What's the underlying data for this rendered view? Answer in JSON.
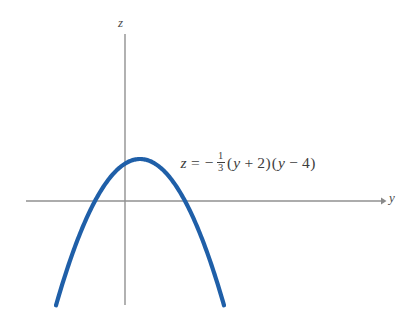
{
  "figure": {
    "background_color": "#ffffff",
    "width": 413,
    "height": 317
  },
  "axes": {
    "color": "#919191",
    "vertical": {
      "label": "z",
      "x_px": 125,
      "y_top_px": 34,
      "y_bottom_px": 305
    },
    "horizontal": {
      "label": "y",
      "y_px": 201,
      "x_left_px": 26,
      "x_right_px": 385,
      "arrowhead": true
    }
  },
  "equation": {
    "lhs": "z",
    "equals": "=",
    "minus": "−",
    "fraction": {
      "numerator": "1",
      "denominator": "3"
    },
    "factor_one": {
      "open": "(",
      "variable": "y",
      "operator": "+",
      "constant": "2",
      "close": ")"
    },
    "factor_two": {
      "open": "(",
      "variable": "y",
      "operator": "−",
      "constant": "4",
      "close": ")"
    },
    "plain_text": "z = − 1/3 (y + 2)(y − 4)"
  },
  "chart_data": {
    "type": "line",
    "title": "",
    "xlabel": "y",
    "ylabel": "z",
    "curve_color": "#1f5fa8",
    "curve_width_px": 4.2,
    "grid": false,
    "legend": null,
    "annotations": [
      {
        "text": "z = − 1/3 (y + 2)(y − 4)",
        "x_px": 180,
        "y_px": 166
      }
    ],
    "function": "z = -(1/3)*(y + 2)*(y - 4)",
    "roots": [
      -2,
      4
    ],
    "vertex": {
      "y": 1,
      "z": 3
    },
    "xlim": [
      -4.6,
      7.1
    ],
    "ylim": [
      -5.1,
      5.5
    ],
    "x": [
      -4.6,
      -4.0,
      -3.5,
      -3.0,
      -2.5,
      -2.0,
      -1.5,
      -1.0,
      -0.5,
      0.0,
      0.5,
      1.0,
      1.5,
      2.0,
      2.5,
      3.0,
      3.5,
      4.0,
      4.5,
      5.0,
      5.5,
      6.0,
      6.5,
      7.1
    ],
    "values": [
      -4.37,
      -2.67,
      -1.75,
      -0.98,
      -0.42,
      0.0,
      0.29,
      0.42,
      0.44,
      0.33,
      0.08,
      3.0,
      2.92,
      2.67,
      2.25,
      1.67,
      0.92,
      0.0,
      -1.08,
      -2.33,
      -3.75,
      -5.33,
      -7.08,
      -9.37
    ],
    "pixel_geometry": {
      "origin_px": {
        "x": 125,
        "y": 201
      },
      "scale_x_px_per_unit": 15.0,
      "scale_y_px_per_unit": 14.0,
      "vertex_px": {
        "x": 133,
        "y": 159
      },
      "left_root_px": {
        "x": 95,
        "y": 201
      },
      "right_root_px": {
        "x": 185,
        "y": 201
      },
      "left_endpoint_px": {
        "x": 56,
        "y": 272
      },
      "right_endpoint_px": {
        "x": 224,
        "y": 272
      }
    }
  }
}
